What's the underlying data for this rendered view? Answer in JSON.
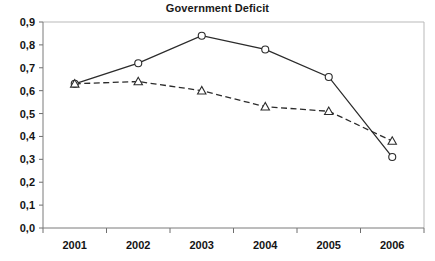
{
  "chart_data": {
    "type": "line",
    "title": "Government Deficit",
    "xlabel": "",
    "ylabel": "",
    "categories": [
      "2001",
      "2002",
      "2003",
      "2004",
      "2005",
      "2006"
    ],
    "ylim": [
      0.0,
      0.9
    ],
    "ytick_labels": [
      "0,9",
      "0,8",
      "0,7",
      "0,6",
      "0,5",
      "0,4",
      "0,3",
      "0,2",
      "0,1",
      "0,0"
    ],
    "ytick_values": [
      0.9,
      0.8,
      0.7,
      0.6,
      0.5,
      0.4,
      0.3,
      0.2,
      0.1,
      0.0
    ],
    "decimal_separator": ",",
    "grid": false,
    "legend": "none",
    "series": [
      {
        "name": "series-solid-circle",
        "line_style": "solid",
        "marker": "open-circle",
        "color": "#2b2b2b",
        "values": [
          0.63,
          0.72,
          0.84,
          0.78,
          0.66,
          0.31
        ]
      },
      {
        "name": "series-dashed-triangle",
        "line_style": "dashed",
        "marker": "open-triangle",
        "color": "#2b2b2b",
        "values": [
          0.63,
          0.64,
          0.6,
          0.53,
          0.51,
          0.38
        ]
      }
    ]
  }
}
